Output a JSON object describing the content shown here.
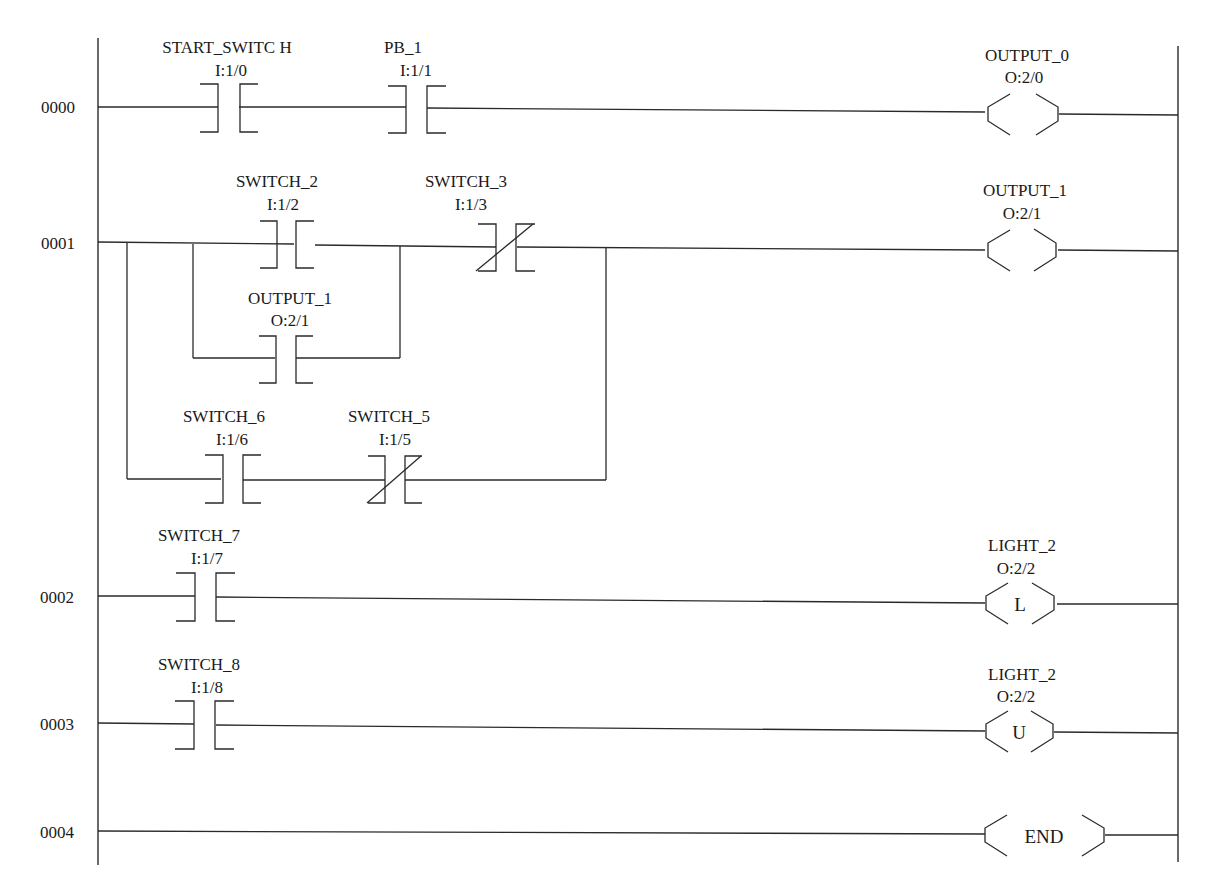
{
  "diagram": {
    "type": "ladder-logic",
    "rungs": [
      {
        "number": "0000",
        "contacts": [
          {
            "name": "START_SWITC H",
            "address": "I:1/0",
            "kind": "XIC"
          },
          {
            "name": "PB_1",
            "address": "I:1/1",
            "kind": "XIC"
          }
        ],
        "coil": {
          "name": "OUTPUT_0",
          "address": "O:2/0",
          "kind": "OTE",
          "text": ""
        }
      },
      {
        "number": "0001",
        "contacts": [
          {
            "name": "SWITCH_2",
            "address": "I:1/2",
            "kind": "XIC"
          },
          {
            "name": "SWITCH_3",
            "address": "I:1/3",
            "kind": "XIO"
          },
          {
            "name": "OUTPUT_1",
            "address": "O:2/1",
            "kind": "XIC"
          },
          {
            "name": "SWITCH_6",
            "address": "I:1/6",
            "kind": "XIC"
          },
          {
            "name": "SWITCH_5",
            "address": "I:1/5",
            "kind": "XIO"
          }
        ],
        "coil": {
          "name": "OUTPUT_1",
          "address": "O:2/1",
          "kind": "OTE",
          "text": ""
        }
      },
      {
        "number": "0002",
        "contacts": [
          {
            "name": "SWITCH_7",
            "address": "I:1/7",
            "kind": "XIC"
          }
        ],
        "coil": {
          "name": "LIGHT_2",
          "address": "O:2/2",
          "kind": "OTL",
          "text": "L"
        }
      },
      {
        "number": "0003",
        "contacts": [
          {
            "name": "SWITCH_8",
            "address": "I:1/8",
            "kind": "XIC"
          }
        ],
        "coil": {
          "name": "LIGHT_2",
          "address": "O:2/2",
          "kind": "OTU",
          "text": "U"
        }
      },
      {
        "number": "0004",
        "contacts": [],
        "coil": {
          "name": "",
          "address": "",
          "kind": "END",
          "text": "END"
        }
      }
    ]
  }
}
